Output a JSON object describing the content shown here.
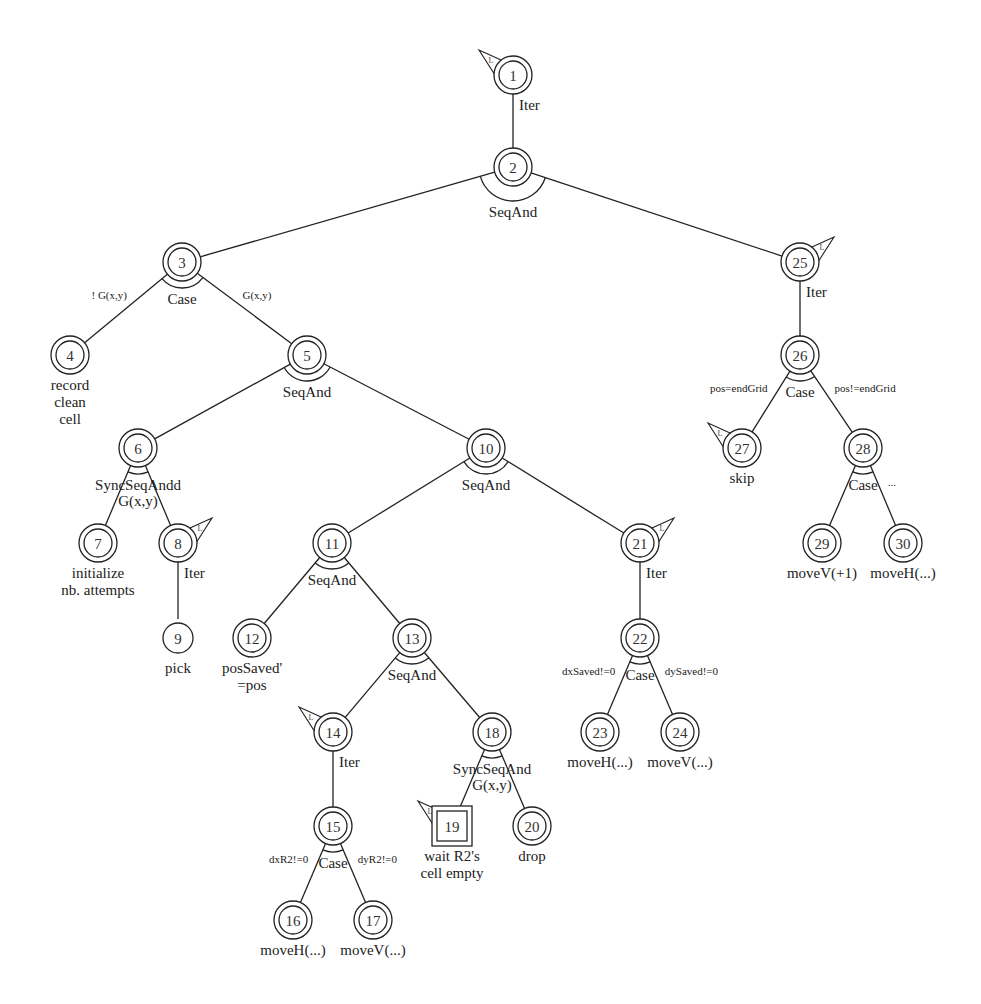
{
  "diagram": {
    "type": "task-tree",
    "nodes": [
      {
        "id": 1,
        "x": 513,
        "y": 75,
        "shape": "double-circle",
        "flag": "left",
        "label": null
      },
      {
        "id": 2,
        "x": 513,
        "y": 167,
        "shape": "double-circle",
        "flag": null,
        "label": null
      },
      {
        "id": 3,
        "x": 182,
        "y": 262,
        "shape": "double-circle",
        "flag": null,
        "label": null
      },
      {
        "id": 4,
        "x": 70,
        "y": 355,
        "shape": "double-circle",
        "flag": null,
        "label": [
          "record",
          "clean",
          "cell"
        ]
      },
      {
        "id": 5,
        "x": 307,
        "y": 355,
        "shape": "double-circle",
        "flag": null,
        "label": null
      },
      {
        "id": 6,
        "x": 138,
        "y": 448,
        "shape": "double-circle",
        "flag": null,
        "label": null
      },
      {
        "id": 7,
        "x": 98,
        "y": 543,
        "shape": "double-circle",
        "flag": null,
        "label": [
          "initialize",
          "nb. attempts"
        ]
      },
      {
        "id": 8,
        "x": 178,
        "y": 543,
        "shape": "double-circle",
        "flag": "right",
        "label": null
      },
      {
        "id": 9,
        "x": 178,
        "y": 638,
        "shape": "circle",
        "flag": null,
        "label": [
          "pick"
        ]
      },
      {
        "id": 10,
        "x": 486,
        "y": 448,
        "shape": "double-circle",
        "flag": null,
        "label": null
      },
      {
        "id": 11,
        "x": 332,
        "y": 543,
        "shape": "double-circle",
        "flag": null,
        "label": null
      },
      {
        "id": 12,
        "x": 252,
        "y": 638,
        "shape": "double-circle",
        "flag": null,
        "label": [
          "posSaved'",
          "=pos"
        ]
      },
      {
        "id": 13,
        "x": 412,
        "y": 638,
        "shape": "double-circle",
        "flag": null,
        "label": null
      },
      {
        "id": 14,
        "x": 333,
        "y": 732,
        "shape": "double-circle",
        "flag": "left",
        "label": null
      },
      {
        "id": 15,
        "x": 333,
        "y": 826,
        "shape": "double-circle",
        "flag": null,
        "label": null
      },
      {
        "id": 16,
        "x": 293,
        "y": 920,
        "shape": "double-circle",
        "flag": null,
        "label": [
          "moveH(...)"
        ]
      },
      {
        "id": 17,
        "x": 373,
        "y": 920,
        "shape": "double-circle",
        "flag": null,
        "label": [
          "moveV(...)"
        ]
      },
      {
        "id": 18,
        "x": 492,
        "y": 732,
        "shape": "double-circle",
        "flag": null,
        "label": null
      },
      {
        "id": 19,
        "x": 452,
        "y": 826,
        "shape": "double-square",
        "flag": "left",
        "label": [
          "wait R2's",
          "cell empty"
        ]
      },
      {
        "id": 20,
        "x": 532,
        "y": 826,
        "shape": "double-circle",
        "flag": null,
        "label": [
          "drop"
        ]
      },
      {
        "id": 21,
        "x": 640,
        "y": 543,
        "shape": "double-circle",
        "flag": "right",
        "label": null
      },
      {
        "id": 22,
        "x": 640,
        "y": 638,
        "shape": "double-circle",
        "flag": null,
        "label": null
      },
      {
        "id": 23,
        "x": 600,
        "y": 732,
        "shape": "double-circle",
        "flag": null,
        "label": [
          "moveH(...)"
        ]
      },
      {
        "id": 24,
        "x": 680,
        "y": 732,
        "shape": "double-circle",
        "flag": null,
        "label": [
          "moveV(...)"
        ]
      },
      {
        "id": 25,
        "x": 800,
        "y": 262,
        "shape": "double-circle",
        "flag": "right",
        "label": null
      },
      {
        "id": 26,
        "x": 800,
        "y": 355,
        "shape": "double-circle",
        "flag": null,
        "label": null
      },
      {
        "id": 27,
        "x": 742,
        "y": 448,
        "shape": "double-circle",
        "flag": "left",
        "label": [
          "skip"
        ]
      },
      {
        "id": 28,
        "x": 863,
        "y": 448,
        "shape": "double-circle",
        "flag": null,
        "label": null
      },
      {
        "id": 29,
        "x": 822,
        "y": 543,
        "shape": "double-circle",
        "flag": null,
        "label": [
          "moveV(+1)"
        ]
      },
      {
        "id": 30,
        "x": 903,
        "y": 543,
        "shape": "double-circle",
        "flag": null,
        "label": [
          "moveH(...)"
        ]
      }
    ],
    "edges": [
      {
        "from": 1,
        "to": 2
      },
      {
        "from": 2,
        "to": 3
      },
      {
        "from": 2,
        "to": 25
      },
      {
        "from": 3,
        "to": 4,
        "guard": "! G(x,y)"
      },
      {
        "from": 3,
        "to": 5,
        "guard": "G(x,y)"
      },
      {
        "from": 5,
        "to": 6
      },
      {
        "from": 5,
        "to": 10
      },
      {
        "from": 6,
        "to": 7
      },
      {
        "from": 6,
        "to": 8
      },
      {
        "from": 8,
        "to": 9
      },
      {
        "from": 10,
        "to": 11
      },
      {
        "from": 10,
        "to": 21
      },
      {
        "from": 11,
        "to": 12
      },
      {
        "from": 11,
        "to": 13
      },
      {
        "from": 13,
        "to": 14
      },
      {
        "from": 13,
        "to": 18
      },
      {
        "from": 14,
        "to": 15
      },
      {
        "from": 15,
        "to": 16,
        "guard": "dxR2!=0"
      },
      {
        "from": 15,
        "to": 17,
        "guard": "dyR2!=0"
      },
      {
        "from": 18,
        "to": 19
      },
      {
        "from": 18,
        "to": 20
      },
      {
        "from": 21,
        "to": 22
      },
      {
        "from": 22,
        "to": 23,
        "guard": "dxSaved!=0"
      },
      {
        "from": 22,
        "to": 24,
        "guard": "dySaved!=0"
      },
      {
        "from": 25,
        "to": 26
      },
      {
        "from": 26,
        "to": 27,
        "guard": "pos=endGrid"
      },
      {
        "from": 26,
        "to": 28,
        "guard": "pos!=endGrid"
      },
      {
        "from": 28,
        "to": 29
      },
      {
        "from": 28,
        "to": 30,
        "guard": "..."
      }
    ],
    "operators": [
      {
        "node": 1,
        "op": "Iter"
      },
      {
        "node": 2,
        "op": "SeqAnd"
      },
      {
        "node": 3,
        "op": "Case"
      },
      {
        "node": 5,
        "op": "SeqAnd"
      },
      {
        "node": 6,
        "op": "SyncSeqAndd",
        "sub": "G(x,y)"
      },
      {
        "node": 8,
        "op": "Iter"
      },
      {
        "node": 10,
        "op": "SeqAnd"
      },
      {
        "node": 11,
        "op": "SeqAnd"
      },
      {
        "node": 13,
        "op": "SeqAnd"
      },
      {
        "node": 14,
        "op": "Iter"
      },
      {
        "node": 15,
        "op": "Case"
      },
      {
        "node": 18,
        "op": "SyncSeqAnd",
        "sub": "G(x,y)"
      },
      {
        "node": 21,
        "op": "Iter"
      },
      {
        "node": 22,
        "op": "Case"
      },
      {
        "node": 25,
        "op": "Iter"
      },
      {
        "node": 26,
        "op": "Case"
      },
      {
        "node": 28,
        "op": "Case"
      }
    ],
    "colors": {
      "stroke": "#222222",
      "text": "#222222",
      "background": "#ffffff"
    }
  }
}
